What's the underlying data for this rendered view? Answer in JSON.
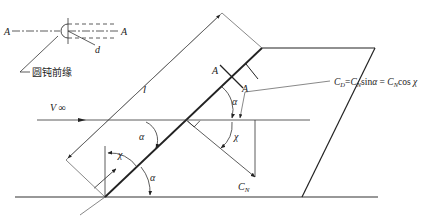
{
  "diagram": {
    "inset": {
      "section_label_left": "A",
      "section_label_right": "A",
      "diameter_label": "d",
      "leading_edge_caption": "圆钝前缘"
    },
    "labels": {
      "length": "l",
      "freestream": "V ∞",
      "section_top_left": "A",
      "section_top_right": "A",
      "alpha_upper": "α",
      "chi_right": "χ",
      "alpha_mid": "α",
      "chi_lower": "χ",
      "alpha_lower": "α",
      "normal_force": "C",
      "normal_force_sub": "N",
      "formula": "C_D=C_N sinα = C_N cos χ"
    },
    "formula_parts": {
      "cd": "C",
      "cd_sub": "D",
      "eq1": "=",
      "cn1": "C",
      "cn1_sub": "N",
      "sin": "sin",
      "alpha": "α",
      "eq2": " = ",
      "cn2": "C",
      "cn2_sub": "N",
      "cos": "cos",
      "chi": " χ"
    }
  }
}
